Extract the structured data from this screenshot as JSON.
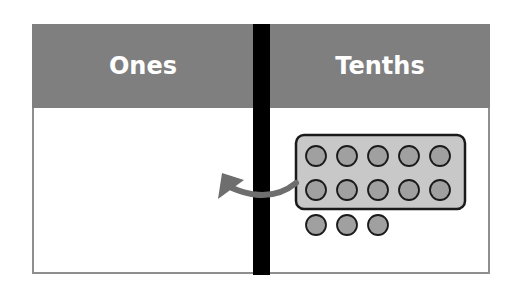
{
  "columns": [
    {
      "label": "Ones"
    },
    {
      "label": "Tenths"
    }
  ],
  "colors": {
    "header_bg": "#7f7f7f",
    "header_text": "#ffffff",
    "divider": "#000000",
    "group_fill": "#c8c8c8",
    "counter_fill": "#a0a0a0",
    "arrow": "#6e6e6e"
  },
  "tenths_column": {
    "grouped_counters": 10,
    "group_rows": 2,
    "group_cols": 5,
    "loose_counters": 3
  },
  "arrow": {
    "direction": "from tenths group to ones column"
  }
}
